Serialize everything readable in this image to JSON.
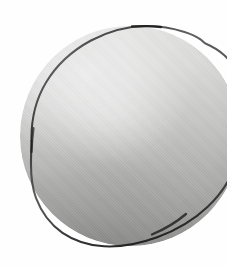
{
  "image": {
    "kind": "scanned-photograph",
    "medium": "halftone print scan",
    "color_mode": "grayscale",
    "width": 227,
    "height": 267,
    "background_color": "#fefefe",
    "caption": "",
    "visible_text": ""
  },
  "subject": {
    "name": "circular-object",
    "description": "Large shaded circular disc or sphere, cropped by the right edge of the frame",
    "shape": "circle",
    "clipped_edges": "right",
    "center_x": 130,
    "center_y": 136,
    "radius": 110,
    "bounds": {
      "left": 31,
      "top": 26,
      "right": 240,
      "bottom": 247
    }
  },
  "shading": {
    "light_direction": "upper-left",
    "highlight_color": "#f7f7f6",
    "midtone_color": "#c6c6c5",
    "shadow_color": "#9f9f9e",
    "rim_color": "#2e2e2e",
    "gradient_axis": "vertical",
    "gradient_stops": [
      {
        "position": "0%",
        "value": "#f2f2f1"
      },
      {
        "position": "22%",
        "value": "#e6e6e5"
      },
      {
        "position": "45%",
        "value": "#cfcfce"
      },
      {
        "position": "67%",
        "value": "#b6b6b5"
      },
      {
        "position": "100%",
        "value": "#9f9f9e"
      }
    ]
  },
  "texture": {
    "type": "halftone-dot-grain",
    "dot_pitch_px": 2,
    "opacity": 0.3
  }
}
